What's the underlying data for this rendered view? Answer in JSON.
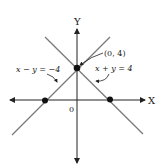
{
  "diagram": {
    "type": "coordinate-graph",
    "axes": {
      "x_label": "X",
      "y_label": "Y",
      "origin_label": "0"
    },
    "lines": [
      {
        "equation": "x − y = −4",
        "label": "x − y = −4"
      },
      {
        "equation": "x + y = 4",
        "label": "x + y = 4"
      }
    ],
    "points": [
      {
        "label": "(0, 4)",
        "coords": [
          0,
          4
        ]
      },
      {
        "coords": [
          -4,
          0
        ]
      },
      {
        "coords": [
          4,
          0
        ]
      }
    ],
    "colors": {
      "axis": "#222222",
      "line": "#7a7a7a",
      "point": "#111111"
    }
  }
}
